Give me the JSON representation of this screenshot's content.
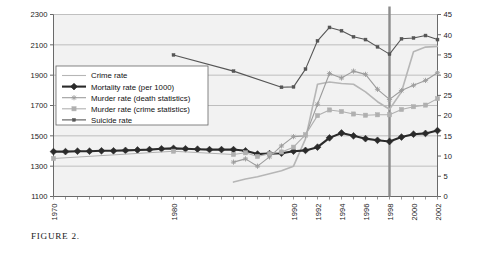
{
  "figure": {
    "caption": "FIGURE 2."
  },
  "chart_data": {
    "type": "line",
    "title": "",
    "xlabel": "",
    "ylabel": "",
    "grid": true,
    "legend_position": "upper-left-inside",
    "x": [
      1970,
      1971,
      1972,
      1973,
      1974,
      1975,
      1976,
      1977,
      1978,
      1979,
      1980,
      1981,
      1982,
      1983,
      1984,
      1985,
      1986,
      1987,
      1988,
      1989,
      1990,
      1991,
      1992,
      1993,
      1994,
      1995,
      1996,
      1997,
      1998,
      1999,
      2000,
      2001,
      2002
    ],
    "xtick_labels": [
      "1970",
      "1980",
      "1990",
      "1992",
      "1994",
      "1996",
      "1998",
      "2000",
      "2002"
    ],
    "xtick_values": [
      1970,
      1980,
      1990,
      1992,
      1994,
      1996,
      1998,
      2000,
      2002
    ],
    "left_axis": {
      "label": "",
      "ylim": [
        1100,
        2300
      ],
      "ticks": [
        1100,
        1300,
        1500,
        1700,
        1900,
        2100,
        2300
      ]
    },
    "right_axis": {
      "label": "",
      "ylim": [
        0,
        45
      ],
      "ticks": [
        0,
        5,
        10,
        15,
        20,
        25,
        30,
        35,
        40,
        45
      ]
    },
    "marker_line_x": 1998,
    "series": [
      {
        "name": "Crime rate",
        "axis": "left",
        "color": "#b6b6b6",
        "marker": "none",
        "linewidth": 1.6,
        "x": [
          1985,
          1986,
          1987,
          1988,
          1989,
          1990,
          1991,
          1992,
          1993,
          1994,
          1995,
          1996,
          1997,
          1998,
          1999,
          2000,
          2001,
          2002
        ],
        "values": [
          1195,
          1215,
          1230,
          1250,
          1270,
          1300,
          1480,
          1840,
          1855,
          1845,
          1840,
          1790,
          1725,
          1675,
          1790,
          2055,
          2085,
          2090
        ]
      },
      {
        "name": "Mortality rate (per 1000)",
        "axis": "right",
        "color": "#2a2a2a",
        "marker": "diamond",
        "linewidth": 2.1,
        "x": [
          1970,
          1971,
          1972,
          1973,
          1974,
          1975,
          1976,
          1977,
          1978,
          1979,
          1980,
          1981,
          1982,
          1983,
          1984,
          1985,
          1986,
          1987,
          1988,
          1989,
          1990,
          1991,
          1992,
          1993,
          1994,
          1995,
          1996,
          1997,
          1998,
          1999,
          2000,
          2001,
          2002
        ],
        "values": [
          11.1,
          11.1,
          11.2,
          11.2,
          11.3,
          11.3,
          11.4,
          11.5,
          11.6,
          11.8,
          11.9,
          11.8,
          11.7,
          11.6,
          11.6,
          11.6,
          11.3,
          10.5,
          10.6,
          10.7,
          11.2,
          11.4,
          12.2,
          14.5,
          15.7,
          15.0,
          14.3,
          13.9,
          13.6,
          14.7,
          15.4,
          15.6,
          16.3
        ]
      },
      {
        "name": "Murder rate (death statistics)",
        "axis": "right",
        "color": "#9c9c9c",
        "marker": "star",
        "linewidth": 1.1,
        "x": [
          1985,
          1986,
          1987,
          1988,
          1989,
          1990,
          1991,
          1992,
          1993,
          1994,
          1995,
          1996,
          1997,
          1998,
          1999,
          2000,
          2001,
          2002
        ],
        "values": [
          8.5,
          9.3,
          7.5,
          9.8,
          12.5,
          14.8,
          15.0,
          22.8,
          30.4,
          29.3,
          31.0,
          30.2,
          26.5,
          24.0,
          26.2,
          27.5,
          28.7,
          30.6
        ]
      },
      {
        "name": "Murder rate (crime statistics)",
        "axis": "right",
        "color": "#b0b0b0",
        "marker": "square",
        "linewidth": 1.1,
        "x": [
          1970,
          1980,
          1985,
          1986,
          1987,
          1988,
          1989,
          1990,
          1991,
          1992,
          1993,
          1994,
          1995,
          1996,
          1997,
          1998,
          1999,
          2000,
          2001,
          2002
        ],
        "values": [
          9.4,
          11.2,
          10.4,
          10.8,
          9.9,
          10.6,
          11.0,
          12.2,
          15.3,
          20.0,
          21.4,
          21.0,
          20.4,
          20.1,
          20.2,
          20.2,
          21.5,
          22.2,
          22.6,
          24.2
        ]
      },
      {
        "name": "Suicide rate",
        "axis": "right",
        "color": "#565656",
        "marker": "dash-dot",
        "linewidth": 1.1,
        "x": [
          1980,
          1985,
          1989,
          1990,
          1991,
          1992,
          1993,
          1994,
          1995,
          1996,
          1997,
          1998,
          1999,
          2000,
          2001,
          2002
        ],
        "values": [
          35.0,
          31.0,
          27.0,
          27.1,
          31.5,
          38.5,
          41.8,
          41.0,
          39.5,
          38.8,
          37.0,
          35.2,
          39.0,
          39.2,
          39.8,
          38.8
        ]
      }
    ],
    "legend": [
      {
        "label": "Crime rate",
        "color": "#b6b6b6",
        "marker": "none"
      },
      {
        "label": "Mortality rate (per 1000)",
        "color": "#2a2a2a",
        "marker": "diamond"
      },
      {
        "label": "Murder rate (death statistics)",
        "color": "#9c9c9c",
        "marker": "star"
      },
      {
        "label": "Murder rate (crime statistics)",
        "color": "#b0b0b0",
        "marker": "square"
      },
      {
        "label": "Suicide rate",
        "color": "#565656",
        "marker": "dash-dot"
      }
    ]
  },
  "style": {
    "plot_bg": "#f2f2f2",
    "grid_color": "#a8a8a8",
    "axis_color": "#6a6a6a",
    "marker_line_color": "#8c8c8c",
    "legend_bg": "#ffffff",
    "legend_border": "#666666"
  }
}
